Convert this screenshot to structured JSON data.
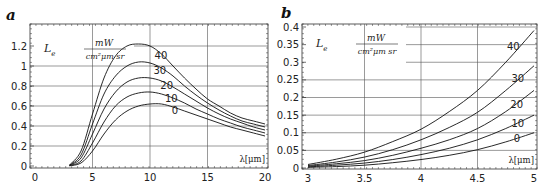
{
  "chart_data": [
    {
      "panel": "a",
      "type": "line",
      "title": "",
      "xlabel": "λ[μm]",
      "ylabel": "L_e  mW / (cm² μm sr)",
      "xlim": [
        0,
        20
      ],
      "ylim": [
        0,
        1.3
      ],
      "xticks": [
        "0",
        "5",
        "10",
        "15",
        "20"
      ],
      "yticks": [
        "0",
        "0.2",
        "0.4",
        "0.6",
        "0.8",
        "1",
        "1.2"
      ],
      "grid": true,
      "x": [
        3,
        4,
        5,
        6,
        7,
        8,
        9,
        10,
        11,
        12,
        13,
        14,
        15,
        16,
        17,
        18,
        19,
        20
      ],
      "series": [
        {
          "name": "40",
          "values": [
            0.01,
            0.15,
            0.52,
            0.88,
            1.1,
            1.2,
            1.22,
            1.2,
            1.12,
            1.0,
            0.88,
            0.77,
            0.67,
            0.6,
            0.53,
            0.48,
            0.45,
            0.42
          ]
        },
        {
          "name": "30",
          "values": [
            0.008,
            0.11,
            0.42,
            0.72,
            0.9,
            1.0,
            1.04,
            1.03,
            0.98,
            0.9,
            0.8,
            0.71,
            0.63,
            0.56,
            0.5,
            0.45,
            0.42,
            0.39
          ]
        },
        {
          "name": "20",
          "values": [
            0.006,
            0.08,
            0.32,
            0.57,
            0.74,
            0.84,
            0.88,
            0.88,
            0.85,
            0.79,
            0.72,
            0.65,
            0.58,
            0.52,
            0.47,
            0.43,
            0.39,
            0.36
          ]
        },
        {
          "name": "10",
          "values": [
            0.004,
            0.05,
            0.23,
            0.44,
            0.6,
            0.69,
            0.73,
            0.74,
            0.72,
            0.68,
            0.63,
            0.57,
            0.52,
            0.47,
            0.43,
            0.39,
            0.36,
            0.33
          ]
        },
        {
          "name": "0",
          "values": [
            0.002,
            0.03,
            0.15,
            0.32,
            0.46,
            0.55,
            0.6,
            0.62,
            0.62,
            0.59,
            0.55,
            0.51,
            0.47,
            0.43,
            0.39,
            0.36,
            0.33,
            0.3
          ]
        }
      ],
      "annotations": [
        "L_e",
        "mW",
        "cm²μm sr",
        "λ[μm]"
      ]
    },
    {
      "panel": "b",
      "type": "line",
      "title": "",
      "xlabel": "λ[μm]",
      "ylabel": "L_e  mW / (cm² μm sr)",
      "xlim": [
        3,
        5
      ],
      "ylim": [
        0,
        0.4
      ],
      "xticks": [
        "3",
        "3.5",
        "4",
        "4.5",
        "5"
      ],
      "yticks": [
        "0",
        "0.05",
        "0.1",
        "0.15",
        "0.2",
        "0.25",
        "0.3",
        "0.35",
        "0.4"
      ],
      "grid": true,
      "x": [
        3,
        3.25,
        3.5,
        3.75,
        4,
        4.25,
        4.5,
        4.75,
        5
      ],
      "series": [
        {
          "name": "40",
          "values": [
            0.01,
            0.025,
            0.045,
            0.075,
            0.11,
            0.16,
            0.22,
            0.3,
            0.39
          ]
        },
        {
          "name": "30",
          "values": [
            0.007,
            0.017,
            0.031,
            0.052,
            0.08,
            0.115,
            0.158,
            0.22,
            0.29
          ]
        },
        {
          "name": "20",
          "values": [
            0.005,
            0.012,
            0.021,
            0.036,
            0.056,
            0.08,
            0.112,
            0.16,
            0.22
          ]
        },
        {
          "name": "10",
          "values": [
            0.003,
            0.008,
            0.014,
            0.024,
            0.038,
            0.056,
            0.08,
            0.112,
            0.15
          ]
        },
        {
          "name": "0",
          "values": [
            0.002,
            0.004,
            0.008,
            0.015,
            0.024,
            0.036,
            0.052,
            0.074,
            0.1
          ]
        }
      ],
      "annotations": [
        "L_e",
        "mW",
        "cm²μm sr",
        "λ[μm]"
      ]
    }
  ],
  "panels": {
    "a": {
      "label": "a",
      "le": "L",
      "le_sub": "e",
      "unit_num": "mW",
      "unit_den": "cm²μm sr",
      "xlabel": "λ[μm]"
    },
    "b": {
      "label": "b",
      "le": "L",
      "le_sub": "e",
      "unit_num": "mW",
      "unit_den": "cm²μm sr",
      "xlabel": "λ[μm]"
    }
  },
  "style": {
    "line_color": "#111111",
    "grid_color": "#555555",
    "axis_color": "#333333"
  }
}
